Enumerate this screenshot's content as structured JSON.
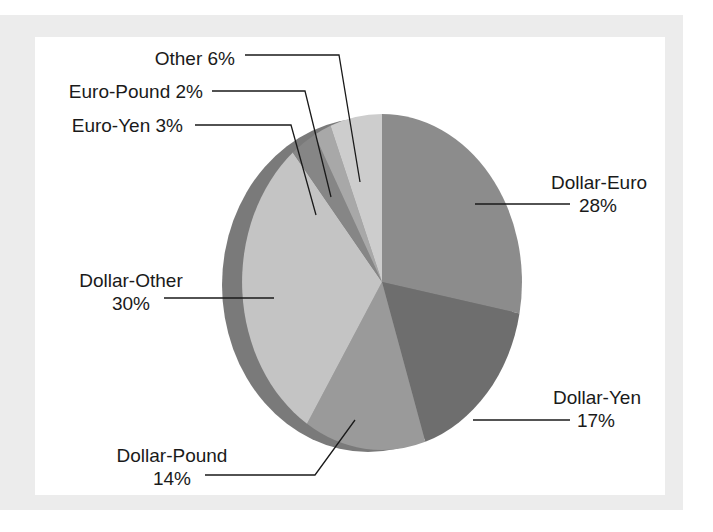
{
  "chart_data": {
    "type": "pie",
    "title": "",
    "style": "3d-tilted-pie",
    "start_angle_deg": 0,
    "direction": "clockwise",
    "slices": [
      {
        "label": "Dollar-Euro",
        "value": 28,
        "display": "28%",
        "color": "#8c8c8c"
      },
      {
        "label": "Dollar-Yen",
        "value": 17,
        "display": "17%",
        "color": "#6e6e6e"
      },
      {
        "label": "Dollar-Pound",
        "value": 14,
        "display": "14%",
        "color": "#9a9a9a"
      },
      {
        "label": "Dollar-Other",
        "value": 30,
        "display": "30%",
        "color": "#c4c4c4"
      },
      {
        "label": "Euro-Yen",
        "value": 3,
        "display": "3%",
        "color": "#868686"
      },
      {
        "label": "Euro-Pound",
        "value": 2,
        "display": "2%",
        "color": "#a8a8a8"
      },
      {
        "label": "Other",
        "value": 6,
        "display": "6%",
        "color": "#cdcdcd"
      }
    ],
    "rim_color": "#7a7a7a",
    "legend": "none (leader-line labels)"
  },
  "labels": {
    "other": {
      "line1": "Other 6%"
    },
    "euro_pound": {
      "line1": "Euro-Pound 2%"
    },
    "euro_yen": {
      "line1": "Euro-Yen 3%"
    },
    "dollar_euro": {
      "line1": "Dollar-Euro",
      "line2": "28%"
    },
    "dollar_other": {
      "line1": "Dollar-Other",
      "line2": "30%"
    },
    "dollar_yen": {
      "line1": "Dollar-Yen",
      "line2": "17%"
    },
    "dollar_pound": {
      "line1": "Dollar-Pound",
      "line2": "14%"
    }
  }
}
